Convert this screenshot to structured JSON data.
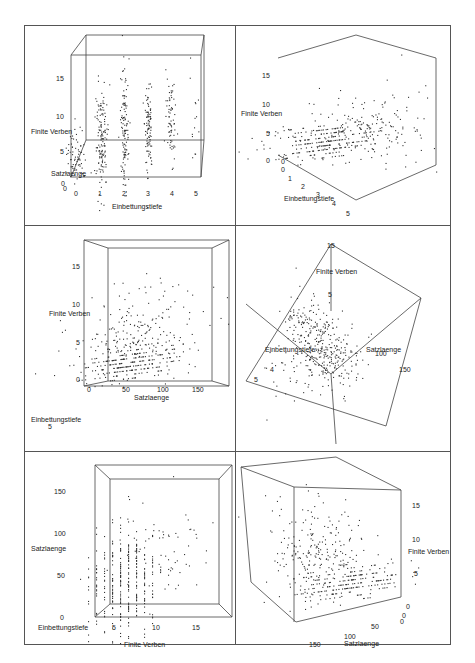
{
  "figure": {
    "panel_count": 6,
    "colors": {
      "frame": "#555555",
      "box": "#444444",
      "points": "#333333",
      "text": "#222222"
    }
  },
  "chart_data": [
    {
      "type": "scatter",
      "title": "",
      "view": "front, Einbettungstiefe on x",
      "xlabel": "Einbettungstiefe",
      "ylabel": "Finite Verben",
      "zlabel": "Satzlaenge",
      "x_ticks": [
        "0",
        "1",
        "2",
        "3",
        "4",
        "5"
      ],
      "y_ticks": [
        "5",
        "10",
        "15"
      ],
      "z_ticks": [
        "0",
        "0",
        "100"
      ],
      "xlim": [
        0,
        5
      ],
      "ylim": [
        0,
        17
      ],
      "note": "Points form vertical columns at Einbettungstiefe 0..5; column 2 spans ~1-13, column 3 ~3-16, column 4 ~5-17"
    },
    {
      "type": "scatter",
      "title": "",
      "view": "oblique",
      "xlabel": "Einbettungstiefe",
      "ylabel": "Finite Verben",
      "x_ticks": [
        "0",
        "1",
        "2",
        "3",
        "4",
        "5"
      ],
      "y_ticks": [
        "0",
        "5",
        "10",
        "15"
      ],
      "xlim": [
        0,
        5
      ],
      "ylim": [
        0,
        17
      ]
    },
    {
      "type": "scatter",
      "title": "",
      "view": "front, Satzlaenge on x",
      "xlabel": "Satzlaenge",
      "ylabel": "Finite Verben",
      "zlabel": "Einbettungstiefe",
      "x_ticks": [
        "0",
        "50",
        "100",
        "150"
      ],
      "y_ticks": [
        "0",
        "5",
        "10",
        "15"
      ],
      "z_ticks": [
        "5"
      ],
      "xlim": [
        0,
        170
      ],
      "ylim": [
        0,
        17
      ]
    },
    {
      "type": "scatter",
      "title": "",
      "view": "top-down rotated cube",
      "xlabel": "Satzlaenge",
      "ylabel": "Finite Verben",
      "zlabel": "Einbettungstiefe",
      "x_ticks": [
        "100",
        "150"
      ],
      "y_ticks": [
        "5",
        "15"
      ],
      "z_ticks": [
        "4",
        "5"
      ]
    },
    {
      "type": "scatter",
      "title": "",
      "view": "front, Finite Verben on x",
      "xlabel": "Finite Verben",
      "ylabel": "Satzlaenge",
      "zlabel": "Einbettungstiefe",
      "x_ticks": [
        "5",
        "10",
        "15"
      ],
      "y_ticks": [
        "0",
        "50",
        "100",
        "150"
      ],
      "z_ticks": [
        "2"
      ],
      "xlim": [
        0,
        17
      ],
      "ylim": [
        0,
        170
      ]
    },
    {
      "type": "scatter",
      "title": "",
      "view": "rear oblique, Satzlaenge reversed",
      "xlabel": "Satzlaenge",
      "ylabel": "Finite Verben",
      "zlabel": "Einbettungstiefe",
      "x_ticks": [
        "150",
        "100",
        "50",
        "0"
      ],
      "y_ticks": [
        "0",
        "5",
        "10",
        "15"
      ],
      "z_ticks": [
        "0"
      ],
      "xlim": [
        170,
        0
      ],
      "ylim": [
        0,
        17
      ]
    }
  ],
  "panels": [
    {
      "x": 24,
      "y": 25,
      "w": 211,
      "h": 200,
      "box": [
        [
          [
            62,
            10
          ],
          [
            180,
            10
          ],
          [
            180,
            115
          ],
          [
            62,
            115
          ]
        ],
        [
          [
            47,
            30
          ],
          [
            177,
            30
          ],
          [
            177,
            152
          ],
          [
            47,
            152
          ]
        ]
      ],
      "labels": [
        {
          "text": "Finite Verben",
          "x": 7,
          "y": 103
        },
        {
          "text": "Satzlaenge",
          "x": 27,
          "y": 145
        },
        {
          "text": "Einbettungstiefe",
          "x": 88,
          "y": 178
        }
      ],
      "ticks": [
        {
          "text": "15",
          "x": 32,
          "y": 50
        },
        {
          "text": "10",
          "x": 32,
          "y": 88
        },
        {
          "text": "5",
          "x": 36,
          "y": 123
        },
        {
          "text": "0",
          "x": 37,
          "y": 155
        },
        {
          "text": "0",
          "x": 39,
          "y": 160
        },
        {
          "text": "0",
          "x": 50,
          "y": 165
        },
        {
          "text": "1",
          "x": 74,
          "y": 165
        },
        {
          "text": "2",
          "x": 98,
          "y": 165
        },
        {
          "text": "3",
          "x": 122,
          "y": 165
        },
        {
          "text": "4",
          "x": 146,
          "y": 165
        },
        {
          "text": "5",
          "x": 170,
          "y": 165
        }
      ],
      "clusters": [
        {
          "cx": 52,
          "cy": 130,
          "sx": 5,
          "sy": 14,
          "n": 70
        },
        {
          "cx": 77,
          "cy": 115,
          "sx": 3,
          "sy": 28,
          "n": 140
        },
        {
          "cx": 100,
          "cy": 105,
          "sx": 2,
          "sy": 28,
          "n": 120
        },
        {
          "cx": 124,
          "cy": 100,
          "sx": 2,
          "sy": 25,
          "n": 100
        },
        {
          "cx": 147,
          "cy": 95,
          "sx": 2.5,
          "sy": 20,
          "n": 70
        },
        {
          "cx": 170,
          "cy": 90,
          "sx": 3,
          "sy": 28,
          "n": 14
        }
      ]
    },
    {
      "x": 236,
      "y": 25,
      "w": 215,
      "h": 200,
      "box": [
        [
          [
            42,
            33
          ],
          [
            120,
            10
          ],
          [
            200,
            33
          ],
          [
            200,
            140
          ],
          [
            120,
            175
          ],
          [
            42,
            130
          ]
        ]
      ],
      "labels": [
        {
          "text": "Finite Verben",
          "x": 5,
          "y": 85
        },
        {
          "text": "Einbettungstiefe",
          "x": 48,
          "y": 170
        }
      ],
      "ticks": [
        {
          "text": "15",
          "x": 26,
          "y": 47
        },
        {
          "text": "10",
          "x": 26,
          "y": 76
        },
        {
          "text": "5",
          "x": 30,
          "y": 105
        },
        {
          "text": "0",
          "x": 30,
          "y": 132
        },
        {
          "text": "0",
          "x": 45,
          "y": 133
        },
        {
          "text": "0",
          "x": 45,
          "y": 141
        },
        {
          "text": "1",
          "x": 52,
          "y": 150
        },
        {
          "text": "2",
          "x": 65,
          "y": 158
        },
        {
          "text": "3",
          "x": 80,
          "y": 166
        },
        {
          "text": "4",
          "x": 96,
          "y": 175
        },
        {
          "text": "5",
          "x": 110,
          "y": 185
        }
      ],
      "clusters": [
        {
          "cx": 90,
          "cy": 115,
          "sx": 30,
          "sy": 10,
          "n": 260,
          "rows": true
        },
        {
          "cx": 120,
          "cy": 105,
          "sx": 35,
          "sy": 18,
          "n": 110
        },
        {
          "cx": 150,
          "cy": 95,
          "sx": 30,
          "sy": 25,
          "n": 40
        }
      ]
    },
    {
      "x": 24,
      "y": 226,
      "w": 211,
      "h": 225,
      "box": [
        [
          [
            60,
            14
          ],
          [
            205,
            14
          ],
          [
            205,
            160
          ],
          [
            60,
            160
          ]
        ],
        [
          [
            84,
            22
          ],
          [
            188,
            22
          ],
          [
            188,
            155
          ],
          [
            84,
            155
          ]
        ]
      ],
      "labels": [
        {
          "text": "Finite Verben",
          "x": 25,
          "y": 84
        },
        {
          "text": "Satzlaenge",
          "x": 110,
          "y": 168
        },
        {
          "text": "Einbettungstiefe",
          "x": 7,
          "y": 190
        }
      ],
      "ticks": [
        {
          "text": "15",
          "x": 48,
          "y": 37
        },
        {
          "text": "10",
          "x": 48,
          "y": 75
        },
        {
          "text": "5",
          "x": 52,
          "y": 113
        },
        {
          "text": "0",
          "x": 52,
          "y": 150
        },
        {
          "text": "0",
          "x": 63,
          "y": 160
        },
        {
          "text": "50",
          "x": 98,
          "y": 160
        },
        {
          "text": "100",
          "x": 133,
          "y": 160
        },
        {
          "text": "150",
          "x": 168,
          "y": 160
        },
        {
          "text": "5",
          "x": 24,
          "y": 197
        }
      ],
      "clusters": [
        {
          "cx": 105,
          "cy": 135,
          "sx": 25,
          "sy": 10,
          "n": 280,
          "rows": true
        },
        {
          "cx": 115,
          "cy": 105,
          "sx": 30,
          "sy": 18,
          "n": 120
        },
        {
          "cx": 135,
          "cy": 75,
          "sx": 30,
          "sy": 20,
          "n": 35
        }
      ]
    },
    {
      "x": 236,
      "y": 226,
      "w": 215,
      "h": 225,
      "box": [
        [
          [
            95,
            18
          ],
          [
            185,
            72
          ],
          [
            150,
            200
          ],
          [
            10,
            155
          ],
          [
            95,
            18
          ]
        ],
        [
          [
            95,
            18
          ],
          [
            95,
            85
          ]
        ],
        [
          [
            10,
            78
          ],
          [
            95,
            148
          ],
          [
            185,
            72
          ]
        ],
        [
          [
            95,
            148
          ],
          [
            100,
            218
          ]
        ]
      ],
      "labels": [
        {
          "text": "Finite Verben",
          "x": 80,
          "y": 42
        },
        {
          "text": "Einbettungstiefe",
          "x": 29,
          "y": 120
        },
        {
          "text": "Satzlaenge",
          "x": 130,
          "y": 120
        }
      ],
      "ticks": [
        {
          "text": "15",
          "x": 91,
          "y": 16
        },
        {
          "text": "5",
          "x": 92,
          "y": 65
        },
        {
          "text": "100",
          "x": 139,
          "y": 124
        },
        {
          "text": "150",
          "x": 163,
          "y": 140
        },
        {
          "text": "4",
          "x": 34,
          "y": 140
        },
        {
          "text": "5",
          "x": 18,
          "y": 150
        }
      ],
      "clusters": [
        {
          "cx": 85,
          "cy": 115,
          "sx": 18,
          "sy": 18,
          "n": 300,
          "diag": true
        },
        {
          "cx": 70,
          "cy": 140,
          "sx": 20,
          "sy": 15,
          "n": 80
        }
      ]
    },
    {
      "x": 24,
      "y": 452,
      "w": 211,
      "h": 193,
      "box": [
        [
          [
            71,
            13
          ],
          [
            208,
            13
          ],
          [
            208,
            165
          ],
          [
            71,
            165
          ]
        ],
        [
          [
            86,
            27
          ],
          [
            195,
            27
          ],
          [
            195,
            152
          ],
          [
            86,
            152
          ]
        ]
      ],
      "labels": [
        {
          "text": "Satzlaenge",
          "x": 7,
          "y": 93
        },
        {
          "text": "Einbettungstiefe",
          "x": 14,
          "y": 172
        },
        {
          "text": "Finite Verben",
          "x": 100,
          "y": 189
        }
      ],
      "ticks": [
        {
          "text": "150",
          "x": 30,
          "y": 36
        },
        {
          "text": "100",
          "x": 30,
          "y": 78
        },
        {
          "text": "50",
          "x": 33,
          "y": 120
        },
        {
          "text": "0",
          "x": 36,
          "y": 162
        },
        {
          "text": "5",
          "x": 88,
          "y": 172
        },
        {
          "text": "10",
          "x": 128,
          "y": 172
        },
        {
          "text": "15",
          "x": 168,
          "y": 172
        }
      ],
      "clusters": [
        {
          "cx": 100,
          "cy": 130,
          "sx": 18,
          "sy": 28,
          "n": 320,
          "cols": true
        },
        {
          "cx": 135,
          "cy": 100,
          "sx": 22,
          "sy": 25,
          "n": 60
        }
      ]
    },
    {
      "x": 236,
      "y": 452,
      "w": 215,
      "h": 193,
      "box": [
        [
          [
            5,
            15
          ],
          [
            100,
            5
          ],
          [
            165,
            38
          ],
          [
            165,
            145
          ],
          [
            60,
            170
          ],
          [
            15,
            130
          ],
          [
            5,
            15
          ]
        ],
        [
          [
            58,
            35
          ],
          [
            165,
            38
          ]
        ],
        [
          [
            58,
            35
          ],
          [
            58,
            170
          ]
        ],
        [
          [
            58,
            35
          ],
          [
            5,
            15
          ]
        ]
      ],
      "labels": [
        {
          "text": "Finite Verben",
          "x": 172,
          "y": 96
        },
        {
          "text": "Satzlaenge",
          "x": 108,
          "y": 188
        }
      ],
      "ticks": [
        {
          "text": "15",
          "x": 176,
          "y": 50
        },
        {
          "text": "10",
          "x": 176,
          "y": 84
        },
        {
          "text": "5",
          "x": 178,
          "y": 118
        },
        {
          "text": "0",
          "x": 170,
          "y": 151
        },
        {
          "text": "0",
          "x": 166,
          "y": 160
        },
        {
          "text": "0",
          "x": 164,
          "y": 166
        },
        {
          "text": "50",
          "x": 135,
          "y": 171
        },
        {
          "text": "100",
          "x": 108,
          "y": 181
        },
        {
          "text": "150",
          "x": 73,
          "y": 189
        }
      ],
      "clusters": [
        {
          "cx": 110,
          "cy": 130,
          "sx": 28,
          "sy": 10,
          "n": 230,
          "rows": true
        },
        {
          "cx": 85,
          "cy": 95,
          "sx": 25,
          "sy": 18,
          "n": 150
        },
        {
          "cx": 65,
          "cy": 70,
          "sx": 25,
          "sy": 18,
          "n": 40
        }
      ]
    }
  ]
}
